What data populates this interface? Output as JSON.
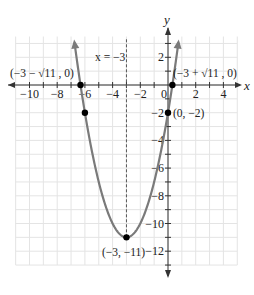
{
  "chart_data": {
    "type": "line",
    "title": "",
    "function": "f(x) = x^2 + 6x - 2",
    "xlabel": "x",
    "ylabel": "y",
    "xlim": [
      -10.5,
      5
    ],
    "ylim": [
      -13,
      3.5
    ],
    "grid": true,
    "x_ticks": [
      -10,
      -8,
      -6,
      -4,
      -2,
      0,
      2,
      4
    ],
    "y_ticks": [
      2,
      -2,
      -4,
      -6,
      -8,
      -10,
      -12
    ],
    "x_tick_labels": [
      "−10",
      "−8",
      "−6",
      "−4",
      "−2",
      "0",
      "2",
      "4"
    ],
    "y_tick_labels": [
      "2",
      "−2",
      "−4",
      "−6",
      "−8",
      "−10",
      "−12"
    ],
    "axis_of_symmetry": {
      "x": -3,
      "label": "x = −3",
      "style": "dashed"
    },
    "vertex": {
      "x": -3,
      "y": -11,
      "label": "(−3, −11)"
    },
    "points": [
      {
        "x": -6.3166,
        "y": 0,
        "label": "(−3 − √11 , 0)"
      },
      {
        "x": 0.3166,
        "y": 0,
        "label": "(−3 + √11 , 0)"
      },
      {
        "x": 0,
        "y": -2,
        "label": "(0, −2)"
      },
      {
        "x": -6,
        "y": -2,
        "label": ""
      },
      {
        "x": -3,
        "y": -11,
        "label": "(−3, −11)"
      }
    ],
    "colors": {
      "curve": "#7a7a7a",
      "axes": "#333333",
      "grid": "#e4e4e4",
      "points": "#000000"
    }
  },
  "labels": {
    "x_axis": "x",
    "y_axis": "y",
    "symmetry": "x = −3",
    "left_intercept": "(−3 − √11 , 0)",
    "right_intercept": "(−3 + √11 , 0)",
    "y_intercept": "(0, −2)",
    "vertex": "(−3, −11)"
  }
}
